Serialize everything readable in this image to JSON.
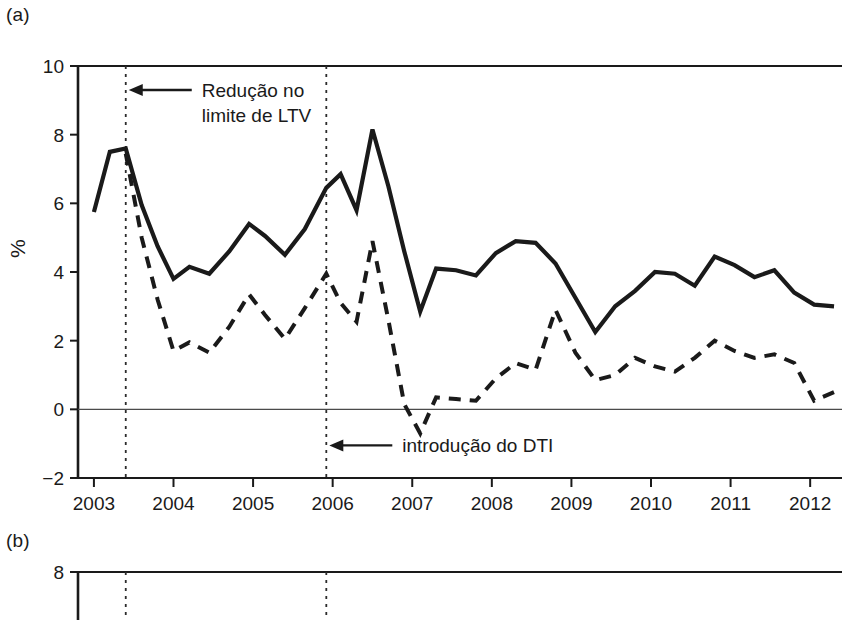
{
  "figure": {
    "panels": [
      {
        "id": "a",
        "label": "(a)"
      },
      {
        "id": "b",
        "label": "(b)"
      }
    ]
  },
  "chart_data": {
    "type": "line",
    "title": "",
    "xlabel": "",
    "ylabel": "%",
    "xlim": [
      2002.8,
      2012.4
    ],
    "ylim": [
      -2,
      10
    ],
    "yticks": [
      -2,
      0,
      2,
      4,
      6,
      8,
      10
    ],
    "ytick_labels": [
      "−2",
      "0",
      "2",
      "4",
      "6",
      "8",
      "10"
    ],
    "xticks": [
      2003,
      2004,
      2005,
      2006,
      2007,
      2008,
      2009,
      2010,
      2011,
      2012
    ],
    "xtick_labels": [
      "2003",
      "2004",
      "2005",
      "2006",
      "2007",
      "2008",
      "2009",
      "2010",
      "2011",
      "2012"
    ],
    "grid": false,
    "legend_position": "none",
    "zero_line": 0,
    "annotations": [
      {
        "name": "ltv-annotation",
        "text_line1": "Redução no",
        "text_line2": "limite de LTV",
        "x": 2003.4,
        "arrow": "left"
      },
      {
        "name": "dti-annotation",
        "text_line1": "introdução do DTI",
        "text_line2": "",
        "x": 2005.92,
        "arrow": "left"
      }
    ],
    "vlines": [
      2003.4,
      2005.92
    ],
    "x": [
      2003.0,
      2003.2,
      2003.4,
      2003.6,
      2003.8,
      2004.0,
      2004.2,
      2004.45,
      2004.7,
      2004.95,
      2005.15,
      2005.4,
      2005.65,
      2005.92,
      2006.1,
      2006.3,
      2006.5,
      2006.7,
      2006.9,
      2007.1,
      2007.3,
      2007.55,
      2007.8,
      2008.05,
      2008.3,
      2008.55,
      2008.8,
      2009.05,
      2009.3,
      2009.55,
      2009.8,
      2010.05,
      2010.3,
      2010.55,
      2010.8,
      2011.05,
      2011.3,
      2011.55,
      2011.8,
      2012.05,
      2012.3
    ],
    "series": [
      {
        "name": "solid-series",
        "style": "solid",
        "color": "#1a1a1a",
        "values": [
          5.75,
          7.5,
          7.6,
          5.95,
          4.75,
          3.8,
          4.15,
          3.95,
          4.6,
          5.4,
          5.05,
          4.5,
          5.25,
          6.45,
          6.85,
          5.8,
          8.15,
          6.5,
          4.6,
          2.85,
          4.1,
          4.05,
          3.9,
          4.55,
          4.9,
          4.85,
          4.25,
          3.25,
          2.25,
          3.0,
          3.45,
          4.0,
          3.95,
          3.6,
          4.45,
          4.2,
          3.85,
          4.05,
          3.4,
          3.05,
          3.0
        ]
      },
      {
        "name": "dashed-series",
        "style": "dashed",
        "color": "#1a1a1a",
        "values": [
          null,
          null,
          7.45,
          5.0,
          3.2,
          1.7,
          1.95,
          1.65,
          2.4,
          3.35,
          2.75,
          2.05,
          2.95,
          3.95,
          3.1,
          2.55,
          4.9,
          2.6,
          0.15,
          -0.7,
          0.35,
          0.3,
          0.25,
          0.9,
          1.35,
          1.15,
          2.9,
          1.65,
          0.85,
          1.0,
          1.5,
          1.25,
          1.1,
          1.5,
          2.0,
          1.7,
          1.5,
          1.6,
          1.35,
          0.25,
          0.5
        ]
      }
    ]
  },
  "panel_b": {
    "ytick_labels": [
      "8"
    ],
    "yticks": [
      8
    ],
    "vlines": [
      2003.4,
      2005.92
    ]
  }
}
